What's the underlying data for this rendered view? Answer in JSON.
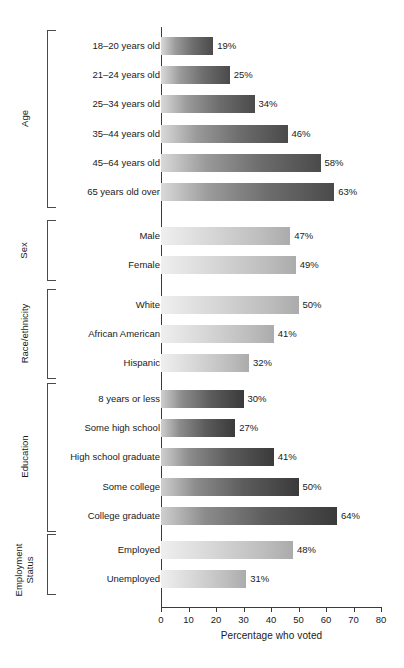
{
  "chart_data": {
    "type": "bar",
    "orientation": "horizontal",
    "title": "",
    "xlabel": "Percentage who voted",
    "ylabel": "",
    "xlim": [
      0,
      80
    ],
    "xticks": [
      0,
      10,
      20,
      30,
      40,
      50,
      60,
      70,
      80
    ],
    "grid": false,
    "legend": false,
    "value_suffix": "%",
    "groups": [
      {
        "name": "Age",
        "categories": [
          "18–20 years old",
          "21–24 years old",
          "25–34 years old",
          "35–44 years old",
          "45–64 years old",
          "65 years old over"
        ],
        "values": [
          19,
          25,
          34,
          46,
          58,
          63
        ],
        "value_labels": [
          "19%",
          "25%",
          "34%",
          "46%",
          "58%",
          "63%"
        ]
      },
      {
        "name": "Sex",
        "categories": [
          "Male",
          "Female"
        ],
        "values": [
          47,
          49
        ],
        "value_labels": [
          "47%",
          "49%"
        ]
      },
      {
        "name": "Race/ethnicity",
        "categories": [
          "White",
          "African American",
          "Hispanic"
        ],
        "values": [
          50,
          41,
          32
        ],
        "value_labels": [
          "50%",
          "41%",
          "32%"
        ]
      },
      {
        "name": "Education",
        "categories": [
          "8 years or less",
          "Some high school",
          "High school graduate",
          "Some college",
          "College graduate"
        ],
        "values": [
          30,
          27,
          41,
          50,
          64
        ],
        "value_labels": [
          "30%",
          "27%",
          "41%",
          "50%",
          "64%"
        ]
      },
      {
        "name": "Employment\nStatus",
        "name_display": "Employment Status",
        "categories": [
          "Employed",
          "Unemployed"
        ],
        "values": [
          48,
          31
        ],
        "value_labels": [
          "48%",
          "31%"
        ]
      }
    ],
    "categories": [
      "18–20 years old",
      "21–24 years old",
      "25–34 years old",
      "35–44 years old",
      "45–64 years old",
      "65 years old over",
      "Male",
      "Female",
      "White",
      "African American",
      "Hispanic",
      "8 years or less",
      "Some high school",
      "High school graduate",
      "Some college",
      "College graduate",
      "Employed",
      "Unemployed"
    ],
    "values": [
      19,
      25,
      34,
      46,
      58,
      63,
      47,
      49,
      50,
      41,
      32,
      30,
      27,
      41,
      50,
      64,
      48,
      31
    ],
    "colors": {
      "bar_light_end": "#efefef",
      "bar_dark_end": "#3a3a3a",
      "axis": "#3a3a3a",
      "text": "#1a1a1a",
      "background": "#ffffff"
    }
  },
  "axis": {
    "tick_labels": [
      "0",
      "10",
      "20",
      "30",
      "40",
      "50",
      "60",
      "70",
      "80"
    ],
    "title": "Percentage who voted"
  }
}
